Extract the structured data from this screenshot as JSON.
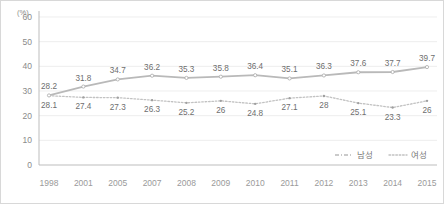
{
  "chart_data": {
    "type": "line",
    "title": "",
    "xlabel": "",
    "ylabel": "(%)",
    "ylim": [
      0,
      60
    ],
    "yticks": [
      0,
      10,
      20,
      30,
      40,
      50,
      60
    ],
    "grid": true,
    "legend_position": "bottom-right",
    "categories": [
      "1998",
      "2001",
      "2005",
      "2007",
      "2008",
      "2009",
      "2010",
      "2011",
      "2012",
      "2013",
      "2014",
      "2015"
    ],
    "series": [
      {
        "name": "남성",
        "style": "dash-dot",
        "color": "#b9b9b9",
        "values": [
          28.2,
          31.8,
          34.7,
          36.2,
          35.3,
          35.8,
          36.4,
          35.1,
          36.3,
          37.6,
          37.7,
          39.7
        ],
        "labels": [
          "28.2",
          "31.8",
          "34.7",
          "36.2",
          "35.3",
          "35.8",
          "36.4",
          "35.1",
          "36.3",
          "37.6",
          "37.7",
          "39.7"
        ]
      },
      {
        "name": "여성",
        "style": "dotted",
        "color": "#c2c2c2",
        "values": [
          28.1,
          27.4,
          27.3,
          26.3,
          25.2,
          26,
          24.8,
          27.1,
          28,
          25.1,
          23.3,
          26
        ],
        "labels": [
          "28.1",
          "27.4",
          "27.3",
          "26.3",
          "25.2",
          "26",
          "24.8",
          "27.1",
          "28",
          "25.1",
          "23.3",
          "26"
        ]
      }
    ]
  },
  "axis": {
    "unit_label": "(%)",
    "y_tick_labels": [
      "60",
      "50",
      "40",
      "30",
      "20",
      "10",
      "0"
    ],
    "x_tick_labels": [
      "1998",
      "2001",
      "2005",
      "2007",
      "2008",
      "2009",
      "2010",
      "2011",
      "2012",
      "2013",
      "2014",
      "2015"
    ]
  },
  "legend": {
    "items": [
      {
        "label": "남성",
        "marker": "dash-dot-line"
      },
      {
        "label": "여성",
        "marker": "dotted-line"
      }
    ]
  },
  "colors": {
    "background": "#ffffff",
    "border": "#d8d8d8",
    "grid": "#e6e6e6",
    "axis": "#b6b6b6",
    "male_series": "#b9b9b9",
    "female_series": "#c2c2c2",
    "tick_text": "#8a8a8a",
    "point_label_text": "#6e6e6e"
  }
}
